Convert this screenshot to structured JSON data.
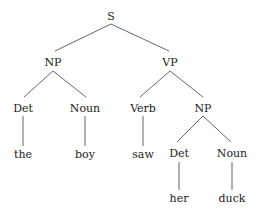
{
  "tree": {
    "root": "S",
    "nodes": {
      "s": "S",
      "np1": "NP",
      "vp": "VP",
      "det1": "Det",
      "noun1": "Noun",
      "verb": "Verb",
      "np2": "NP",
      "det2": "Det",
      "noun2": "Noun"
    },
    "leaves": {
      "the": "the",
      "boy": "boy",
      "saw": "saw",
      "her": "her",
      "duck": "duck"
    }
  },
  "colors": {
    "text": "#222222",
    "edge": "#555555",
    "background": "#ffffff"
  }
}
